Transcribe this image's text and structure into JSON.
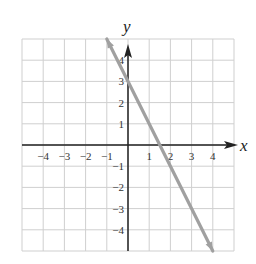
{
  "chart_data": {
    "type": "line",
    "title": "",
    "xlabel": "x",
    "ylabel": "y",
    "xlim": [
      -5,
      5
    ],
    "ylim": [
      -5,
      5
    ],
    "grid": true,
    "x_ticks": [
      "-4",
      "-3",
      "-2",
      "-1",
      "1",
      "2",
      "3",
      "4"
    ],
    "y_ticks": [
      "4",
      "3",
      "2",
      "1",
      "-1",
      "-2",
      "-3",
      "-4"
    ],
    "series": [
      {
        "name": "y = -2x + 3",
        "x": [
          -1,
          4
        ],
        "y": [
          5,
          -5
        ],
        "color": "#a0a0a0",
        "arrows": "both"
      }
    ]
  },
  "labels": {
    "x_axis": "x",
    "y_axis": "y",
    "x_ticks": [
      {
        "v": -4,
        "t": "−4"
      },
      {
        "v": -3,
        "t": "−3"
      },
      {
        "v": -2,
        "t": "−2"
      },
      {
        "v": -1,
        "t": "−1"
      },
      {
        "v": 1,
        "t": "1"
      },
      {
        "v": 2,
        "t": "2"
      },
      {
        "v": 3,
        "t": "3"
      },
      {
        "v": 4,
        "t": "4"
      }
    ],
    "y_ticks": [
      {
        "v": 4,
        "t": "4"
      },
      {
        "v": 3,
        "t": "3"
      },
      {
        "v": 2,
        "t": "2"
      },
      {
        "v": 1,
        "t": "1"
      },
      {
        "v": -1,
        "t": "−1"
      },
      {
        "v": -2,
        "t": "−2"
      },
      {
        "v": -3,
        "t": "−3"
      },
      {
        "v": -4,
        "t": "−4"
      }
    ]
  }
}
